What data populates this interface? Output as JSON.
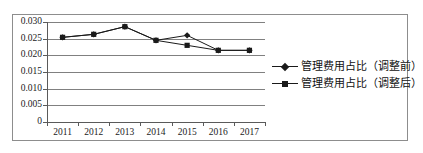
{
  "chart_data": {
    "type": "line",
    "title": "",
    "xlabel": "",
    "ylabel": "",
    "categories": [
      "2011",
      "2012",
      "2013",
      "2014",
      "2015",
      "2016",
      "2017"
    ],
    "ylim": [
      0,
      0.03
    ],
    "ytick_labels": [
      "0.030",
      "0.025",
      "0.020",
      "0.015",
      "0.010",
      "0.005",
      "0"
    ],
    "ytick_values": [
      0.03,
      0.025,
      0.02,
      0.015,
      0.01,
      0.005,
      0
    ],
    "grid": true,
    "legend_position": "right",
    "series": [
      {
        "name": "管理费用占比（调整前）",
        "marker": "diamond",
        "color": "#1a1a1a",
        "values": [
          0.0254,
          0.0263,
          0.0286,
          0.0245,
          0.026,
          0.0215,
          0.0215
        ]
      },
      {
        "name": "管理费用占比（调整后）",
        "marker": "square",
        "color": "#1a1a1a",
        "values": [
          0.0254,
          0.0263,
          0.0286,
          0.0245,
          0.023,
          0.0215,
          0.0215
        ]
      }
    ]
  },
  "legend": {
    "items": [
      {
        "label": "管理费用占比（调整前）",
        "marker": "diamond"
      },
      {
        "label": "管理费用占比（调整后）",
        "marker": "square"
      }
    ]
  }
}
